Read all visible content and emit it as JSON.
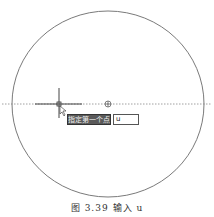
{
  "drawing": {
    "circle": {
      "cx": 108,
      "cy": 104,
      "rx": 96,
      "ry": 93,
      "color": "#7a7a7a"
    },
    "center_marker": {
      "x": 108,
      "y": 104
    },
    "crosshair": {
      "x": 59,
      "y": 104
    },
    "tracking_line_color": "#9a9a9a"
  },
  "prompt": {
    "tooltip_text": "指定第一个点:",
    "input_value": "u"
  },
  "caption": "图 3.39   输入 u"
}
